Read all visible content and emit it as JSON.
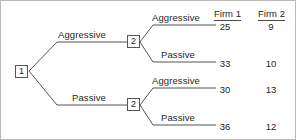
{
  "diagram": {
    "nodes": [
      {
        "id": "n1",
        "label": "1",
        "player": "Firm 1",
        "x": 14,
        "y": 64
      },
      {
        "id": "n2a",
        "label": "2",
        "player": "Firm 2",
        "x": 126,
        "y": 34
      },
      {
        "id": "n2b",
        "label": "2",
        "player": "Firm 2",
        "x": 126,
        "y": 97
      }
    ],
    "branch_labels": {
      "root_upper": "Aggressive",
      "root_lower": "Passive",
      "upper_node_upper": "Aggressive",
      "upper_node_lower": "Passive",
      "lower_node_upper": "Aggressive",
      "lower_node_lower": "Passive"
    },
    "columns": [
      {
        "key": "firm1",
        "header": "Firm 1"
      },
      {
        "key": "firm2",
        "header": "Firm 2"
      }
    ],
    "outcomes": [
      {
        "path": "Aggressive / Aggressive",
        "firm1": "25",
        "firm2": "9"
      },
      {
        "path": "Aggressive / Passive",
        "firm1": "33",
        "firm2": "10"
      },
      {
        "path": "Passive / Aggressive",
        "firm1": "30",
        "firm2": "13"
      },
      {
        "path": "Passive / Passive",
        "firm1": "36",
        "firm2": "12"
      }
    ],
    "colors": {
      "line": "#555555",
      "text": "#262626",
      "background": "#ffffff",
      "border": "#b9b9b9"
    }
  }
}
